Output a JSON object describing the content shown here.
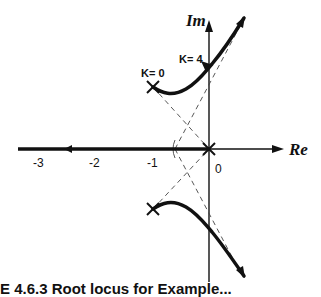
{
  "diagram": {
    "type": "root-locus",
    "axes": {
      "real_label": "Re",
      "imag_label": "Im",
      "ticks": [
        {
          "label": "-3",
          "value": -3
        },
        {
          "label": "-2",
          "value": -2
        },
        {
          "label": "-1",
          "value": -1
        },
        {
          "label": "0",
          "value": 0
        }
      ]
    },
    "annotations": {
      "k_start": "K= 0",
      "k_cross": "K= 4"
    },
    "poles": [
      {
        "re": -1,
        "im": 1
      },
      {
        "re": -1,
        "im": -1
      },
      {
        "re": 0,
        "im": 0
      }
    ],
    "caption": "E 4.6.3   Root locus for Example..."
  },
  "colors": {
    "ink": "#111111",
    "asymptote": "#444444",
    "background": "#ffffff"
  }
}
